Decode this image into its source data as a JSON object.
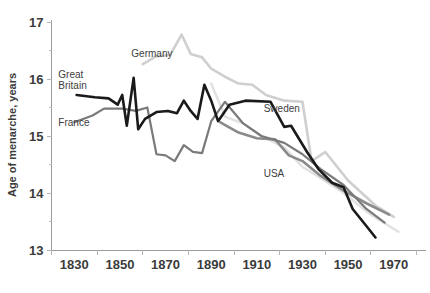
{
  "chart_data": {
    "type": "line",
    "title": "",
    "xlabel": "",
    "ylabel": "Age of menarche, years",
    "xlim": [
      1820,
      1978
    ],
    "ylim": [
      13,
      17
    ],
    "xticks": [
      1830,
      1850,
      1870,
      1890,
      1910,
      1930,
      1950,
      1970
    ],
    "xticklabels": [
      "1830",
      "1850",
      "1870",
      "1890",
      "1910",
      "1930",
      "1950",
      "1970"
    ],
    "yticks": [
      13,
      14,
      15,
      16,
      17
    ],
    "yticklabels": [
      "13",
      "14",
      "15",
      "16",
      "17"
    ],
    "minor_yticks": [
      13.5,
      14.5,
      15.5,
      16.5
    ],
    "grid": false,
    "legend_position": "inline-labels",
    "series": [
      {
        "name": "Great Britain",
        "color": "#1a1a1a",
        "width": 2.6,
        "label_x": 1823,
        "label_y": 16.02,
        "points": [
          [
            1831,
            15.72
          ],
          [
            1839,
            15.68
          ],
          [
            1845,
            15.66
          ],
          [
            1849,
            15.55
          ],
          [
            1851,
            15.72
          ],
          [
            1853,
            15.18
          ],
          [
            1856,
            16.02
          ],
          [
            1858,
            15.12
          ],
          [
            1861,
            15.3
          ],
          [
            1866,
            15.42
          ],
          [
            1871,
            15.44
          ],
          [
            1875,
            15.4
          ],
          [
            1878,
            15.62
          ],
          [
            1881,
            15.44
          ],
          [
            1884,
            15.3
          ],
          [
            1887,
            15.9
          ],
          [
            1890,
            15.62
          ],
          [
            1893,
            15.26
          ],
          [
            1898,
            15.55
          ],
          [
            1905,
            15.62
          ],
          [
            1916,
            15.6
          ],
          [
            1922,
            15.16
          ],
          [
            1925,
            15.18
          ],
          [
            1932,
            14.72
          ],
          [
            1937,
            14.42
          ],
          [
            1943,
            14.18
          ],
          [
            1948,
            14.1
          ],
          [
            1952,
            13.72
          ],
          [
            1958,
            13.42
          ],
          [
            1962,
            13.22
          ]
        ]
      },
      {
        "name": "France",
        "color": "#7a7a7a",
        "width": 2.2,
        "label_x": 1823,
        "label_y": 15.18,
        "points": [
          [
            1830,
            15.24
          ],
          [
            1838,
            15.36
          ],
          [
            1843,
            15.48
          ],
          [
            1851,
            15.48
          ],
          [
            1857,
            15.44
          ],
          [
            1862,
            15.5
          ],
          [
            1866,
            14.68
          ],
          [
            1870,
            14.66
          ],
          [
            1874,
            14.56
          ],
          [
            1878,
            14.84
          ],
          [
            1882,
            14.72
          ],
          [
            1886,
            14.7
          ],
          [
            1890,
            15.26
          ],
          [
            1896,
            15.6
          ],
          [
            1904,
            15.22
          ],
          [
            1912,
            15.0
          ],
          [
            1922,
            14.88
          ],
          [
            1930,
            14.68
          ],
          [
            1938,
            14.42
          ],
          [
            1948,
            14.14
          ],
          [
            1958,
            13.72
          ],
          [
            1966,
            13.48
          ]
        ]
      },
      {
        "name": "Germany",
        "color": "#cfcfcf",
        "width": 2.6,
        "label_x": 1855,
        "label_y": 16.38,
        "points": [
          [
            1860,
            16.26
          ],
          [
            1866,
            16.4
          ],
          [
            1872,
            16.42
          ],
          [
            1877,
            16.78
          ],
          [
            1881,
            16.44
          ],
          [
            1886,
            16.38
          ],
          [
            1890,
            16.18
          ],
          [
            1896,
            16.04
          ],
          [
            1902,
            15.92
          ],
          [
            1908,
            15.9
          ],
          [
            1914,
            15.72
          ],
          [
            1922,
            15.62
          ],
          [
            1930,
            15.6
          ],
          [
            1934,
            14.56
          ],
          [
            1940,
            14.72
          ],
          [
            1950,
            14.22
          ],
          [
            1962,
            13.78
          ],
          [
            1970,
            13.58
          ]
        ]
      },
      {
        "name": "Sweden",
        "color": "#e2e2e2",
        "width": 2.6,
        "label_x": 1913,
        "label_y": 15.42,
        "points": [
          [
            1890,
            15.92
          ],
          [
            1896,
            15.34
          ],
          [
            1904,
            15.22
          ],
          [
            1912,
            15.0
          ],
          [
            1922,
            14.8
          ],
          [
            1930,
            14.46
          ],
          [
            1938,
            14.26
          ],
          [
            1948,
            14.0
          ],
          [
            1960,
            13.62
          ],
          [
            1972,
            13.32
          ]
        ]
      },
      {
        "name": "USA",
        "color": "#8a8a8a",
        "width": 2.6,
        "label_x": 1913,
        "label_y": 14.28,
        "points": [
          [
            1894,
            15.24
          ],
          [
            1902,
            15.06
          ],
          [
            1910,
            14.96
          ],
          [
            1918,
            14.94
          ],
          [
            1924,
            14.66
          ],
          [
            1930,
            14.56
          ],
          [
            1938,
            14.3
          ],
          [
            1948,
            14.04
          ],
          [
            1958,
            13.82
          ],
          [
            1968,
            13.62
          ]
        ]
      }
    ]
  },
  "axis": {
    "y_title": "Age of menarche, years"
  }
}
